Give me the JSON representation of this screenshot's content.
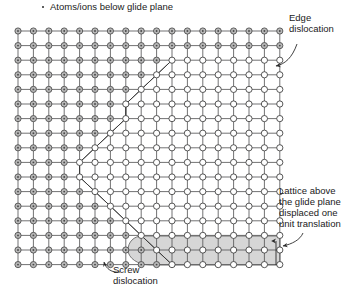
{
  "figure": {
    "title": "Atoms/ions below glide plane",
    "marker_icon": "dot-marker-icon",
    "width": 351,
    "height": 293
  },
  "labels": {
    "edge_dislocation": "Edge\ndislocation",
    "lattice_above": "Lattice above\nthe glide plane\ndisplaced one\nunit translation",
    "screw_dislocation": "Screw\ndislocation"
  },
  "colors": {
    "line": "#58585a",
    "atom_below_fill": "#b8b8b8",
    "atom_below_stroke": "#4a4a4a",
    "atom_above_fill": "#ffffff",
    "atom_above_stroke": "#3a3a3a",
    "slipped_region_fill": "#d6d6d6",
    "slipped_region_stroke": "#6a6a6a",
    "text": "#1a1a1a",
    "arrow": "#2b2b2b"
  },
  "lattice": {
    "origin_x": 18,
    "origin_y": 31,
    "spacing_x": 15.4,
    "spacing_y": 14.6,
    "columns": 18,
    "rows": 17,
    "note": "Square lattice grid of atom sites connected by horizontal and vertical bonds",
    "dislocation_boundary_columns": [
      18,
      18,
      10,
      9,
      8,
      7,
      7,
      6,
      5,
      4,
      4,
      5,
      6,
      7,
      8,
      9,
      10
    ],
    "boundary_description": "Column index per row at which atoms switch from below-glide-plane (shaded) to above-glide-plane (open). Forms a curved dislocation loop line."
  },
  "slipped_region": {
    "label": "shaded slipped area below glide plane",
    "left_x": 128,
    "right_x": 280,
    "top_y": 236,
    "bottom_y": 265
  },
  "annotations": {
    "edge_arrow": "curved-arrow-icon",
    "lattice_arrow": "curved-arrow-icon",
    "screw_arrow": "curved-arrow-icon",
    "translation_arrow": "up-arrow-icon"
  }
}
